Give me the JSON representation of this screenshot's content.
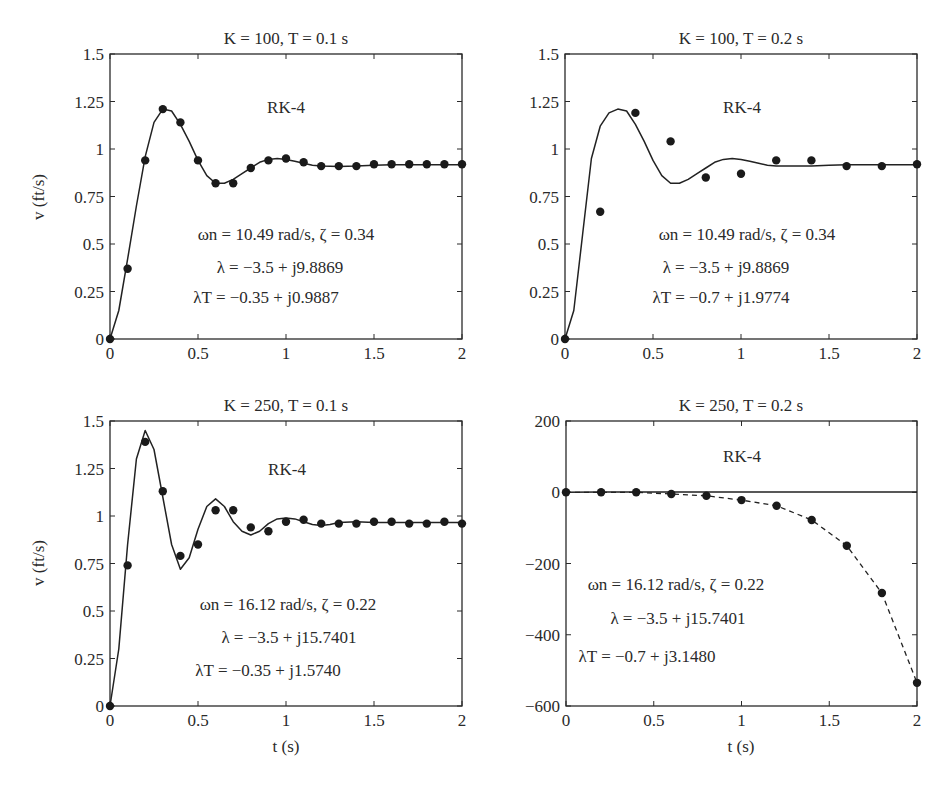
{
  "figure": {
    "ylabel": "v (ft/s)",
    "xlabel": "t (s)"
  },
  "chart_data": [
    {
      "type": "line",
      "title": "K = 100, T = 0.1 s",
      "method_label": "RK-4",
      "annotations": [
        "ωn = 10.49 rad/s, ζ = 0.34",
        "λ = −3.5 + j9.8869",
        "λT = −0.35 + j0.9887"
      ],
      "xlabel": "",
      "ylabel": "v (ft/s)",
      "xlim": [
        0,
        2
      ],
      "ylim": [
        0,
        1.5
      ],
      "xticks": [
        0,
        0.5,
        1,
        1.5,
        2
      ],
      "xtick_labels": [
        "0",
        "0.5",
        "1",
        "1.5",
        "2"
      ],
      "yticks": [
        0,
        0.25,
        0.5,
        0.75,
        1,
        1.25,
        1.5
      ],
      "ytick_labels": [
        "0",
        "0.25",
        "0.5",
        "0.75",
        "1",
        "1.25",
        "1.5"
      ],
      "grid": false,
      "series": [
        {
          "name": "continuous",
          "style": "solid",
          "x": [
            0,
            0.05,
            0.1,
            0.15,
            0.2,
            0.25,
            0.3,
            0.35,
            0.4,
            0.45,
            0.5,
            0.55,
            0.6,
            0.65,
            0.7,
            0.75,
            0.8,
            0.85,
            0.9,
            0.95,
            1.0,
            1.05,
            1.1,
            1.15,
            1.2,
            1.3,
            1.4,
            1.5,
            1.6,
            1.7,
            1.8,
            1.9,
            2.0
          ],
          "y": [
            0,
            0.15,
            0.42,
            0.7,
            0.96,
            1.14,
            1.21,
            1.2,
            1.13,
            1.04,
            0.94,
            0.86,
            0.82,
            0.82,
            0.84,
            0.87,
            0.9,
            0.93,
            0.945,
            0.95,
            0.945,
            0.935,
            0.925,
            0.915,
            0.91,
            0.908,
            0.91,
            0.915,
            0.917,
            0.917,
            0.917,
            0.917,
            0.917
          ]
        },
        {
          "name": "RK-4 discrete",
          "style": "markers",
          "x": [
            0,
            0.1,
            0.2,
            0.3,
            0.4,
            0.5,
            0.6,
            0.7,
            0.8,
            0.9,
            1.0,
            1.1,
            1.2,
            1.3,
            1.4,
            1.5,
            1.6,
            1.7,
            1.8,
            1.9,
            2.0
          ],
          "y": [
            0,
            0.37,
            0.94,
            1.21,
            1.14,
            0.94,
            0.82,
            0.82,
            0.9,
            0.94,
            0.95,
            0.93,
            0.91,
            0.91,
            0.91,
            0.92,
            0.92,
            0.92,
            0.92,
            0.92,
            0.92
          ]
        }
      ]
    },
    {
      "type": "line",
      "title": "K = 100, T = 0.2 s",
      "method_label": "RK-4",
      "annotations": [
        "ωn = 10.49 rad/s, ζ = 0.34",
        "λ = −3.5 + j9.8869",
        "λT = −0.7 + j1.9774"
      ],
      "xlabel": "",
      "ylabel": "",
      "xlim": [
        0,
        2
      ],
      "ylim": [
        0,
        1.5
      ],
      "xticks": [
        0,
        0.5,
        1,
        1.5,
        2
      ],
      "xtick_labels": [
        "0",
        "0.5",
        "1",
        "1.5",
        "2"
      ],
      "yticks": [
        0,
        0.25,
        0.5,
        0.75,
        1,
        1.25,
        1.5
      ],
      "ytick_labels": [
        "0",
        "0.25",
        "0.5",
        "0.75",
        "1",
        "1.25",
        "1.5"
      ],
      "grid": false,
      "series": [
        {
          "name": "continuous",
          "style": "solid",
          "x": [
            0,
            0.05,
            0.1,
            0.15,
            0.2,
            0.25,
            0.3,
            0.35,
            0.4,
            0.45,
            0.5,
            0.55,
            0.6,
            0.65,
            0.7,
            0.75,
            0.8,
            0.85,
            0.9,
            0.95,
            1.0,
            1.05,
            1.1,
            1.15,
            1.2,
            1.3,
            1.4,
            1.5,
            1.6,
            1.7,
            1.8,
            1.9,
            2.0
          ],
          "y": [
            0,
            0.15,
            0.55,
            0.95,
            1.12,
            1.19,
            1.21,
            1.2,
            1.13,
            1.04,
            0.94,
            0.86,
            0.82,
            0.82,
            0.84,
            0.87,
            0.9,
            0.93,
            0.945,
            0.95,
            0.945,
            0.935,
            0.925,
            0.915,
            0.91,
            0.91,
            0.91,
            0.915,
            0.917,
            0.917,
            0.917,
            0.917,
            0.917
          ]
        },
        {
          "name": "RK-4 discrete",
          "style": "markers",
          "x": [
            0,
            0.2,
            0.4,
            0.6,
            0.8,
            1.0,
            1.2,
            1.4,
            1.6,
            1.8,
            2.0
          ],
          "y": [
            0,
            0.67,
            1.19,
            1.04,
            0.85,
            0.87,
            0.94,
            0.94,
            0.91,
            0.91,
            0.92
          ]
        }
      ]
    },
    {
      "type": "line",
      "title": "K = 250, T = 0.1 s",
      "method_label": "RK-4",
      "annotations": [
        "ωn = 16.12 rad/s, ζ = 0.22",
        "λ = −3.5 + j15.7401",
        "λT = −0.35 + j1.5740"
      ],
      "xlabel": "t (s)",
      "ylabel": "v (ft/s)",
      "xlim": [
        0,
        2
      ],
      "ylim": [
        0,
        1.5
      ],
      "xticks": [
        0,
        0.5,
        1,
        1.5,
        2
      ],
      "xtick_labels": [
        "0",
        "0.5",
        "1",
        "1.5",
        "2"
      ],
      "yticks": [
        0,
        0.25,
        0.5,
        0.75,
        1,
        1.25,
        1.5
      ],
      "ytick_labels": [
        "0",
        "0.25",
        "0.5",
        "0.75",
        "1",
        "1.25",
        "1.5"
      ],
      "grid": false,
      "series": [
        {
          "name": "continuous",
          "style": "solid",
          "x": [
            0,
            0.05,
            0.1,
            0.15,
            0.2,
            0.25,
            0.3,
            0.35,
            0.4,
            0.45,
            0.5,
            0.55,
            0.6,
            0.65,
            0.7,
            0.75,
            0.8,
            0.85,
            0.9,
            0.95,
            1.0,
            1.05,
            1.1,
            1.15,
            1.2,
            1.25,
            1.3,
            1.4,
            1.5,
            1.6,
            1.7,
            1.8,
            1.9,
            2.0
          ],
          "y": [
            0,
            0.3,
            0.85,
            1.3,
            1.45,
            1.35,
            1.1,
            0.85,
            0.72,
            0.78,
            0.93,
            1.05,
            1.09,
            1.05,
            0.97,
            0.92,
            0.9,
            0.92,
            0.96,
            0.985,
            0.99,
            0.985,
            0.97,
            0.955,
            0.95,
            0.955,
            0.965,
            0.97,
            0.965,
            0.965,
            0.965,
            0.965,
            0.965,
            0.965
          ]
        },
        {
          "name": "RK-4 discrete",
          "style": "markers",
          "x": [
            0,
            0.1,
            0.2,
            0.3,
            0.4,
            0.5,
            0.6,
            0.7,
            0.8,
            0.9,
            1.0,
            1.1,
            1.2,
            1.3,
            1.4,
            1.5,
            1.6,
            1.7,
            1.8,
            1.9,
            2.0
          ],
          "y": [
            0,
            0.74,
            1.39,
            1.13,
            0.79,
            0.85,
            1.03,
            1.03,
            0.94,
            0.92,
            0.97,
            0.98,
            0.96,
            0.96,
            0.96,
            0.97,
            0.97,
            0.96,
            0.96,
            0.97,
            0.96
          ]
        }
      ]
    },
    {
      "type": "line",
      "title": "K = 250, T = 0.2 s",
      "method_label": "RK-4",
      "annotations": [
        "ωn = 16.12 rad/s, ζ = 0.22",
        "λ = −3.5 + j15.7401",
        "λT = −0.7 + j3.1480"
      ],
      "xlabel": "t (s)",
      "ylabel": "",
      "xlim": [
        0,
        2
      ],
      "ylim": [
        -600,
        200
      ],
      "xticks": [
        0,
        0.5,
        1,
        1.5,
        2
      ],
      "xtick_labels": [
        "0",
        "0.5",
        "1",
        "1.5",
        "2"
      ],
      "yticks": [
        -600,
        -400,
        -200,
        0,
        200
      ],
      "ytick_labels": [
        "−600",
        "−400",
        "−200",
        "0",
        "200"
      ],
      "grid": false,
      "series": [
        {
          "name": "continuous",
          "style": "solid",
          "x": [
            0,
            0.2,
            0.4,
            0.6,
            0.8,
            1.0,
            1.2,
            1.4,
            1.6,
            1.8,
            2.0
          ],
          "y": [
            0,
            1,
            1,
            1,
            1,
            1,
            1,
            1,
            1,
            1,
            1
          ]
        },
        {
          "name": "RK-4 discrete (unstable)",
          "style": "dashed-markers",
          "x": [
            0,
            0.2,
            0.4,
            0.6,
            0.8,
            1.0,
            1.2,
            1.4,
            1.6,
            1.8,
            2.0
          ],
          "y": [
            0,
            0,
            0,
            -5,
            -10,
            -22,
            -38,
            -78,
            -150,
            -283,
            -535
          ]
        }
      ]
    }
  ]
}
